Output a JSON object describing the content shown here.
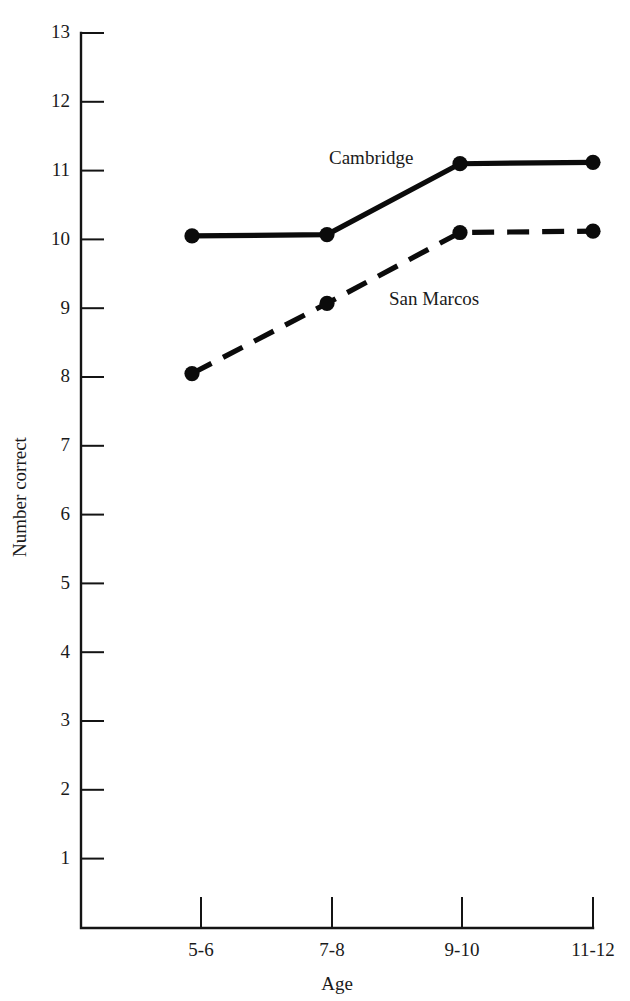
{
  "chart_data": {
    "type": "line",
    "title": "",
    "xlabel": "Age",
    "ylabel": "Number correct",
    "categories": [
      "5-6",
      "7-8",
      "9-10",
      "11-12"
    ],
    "ylim": [
      0,
      13
    ],
    "yticks": [
      1,
      2,
      3,
      4,
      5,
      6,
      7,
      8,
      9,
      10,
      11,
      12,
      13
    ],
    "ytick_labels": [
      "1",
      "2",
      "3",
      "4",
      "5",
      "6",
      "7",
      "8",
      "9",
      "10",
      "11",
      "12",
      "13"
    ],
    "grid": false,
    "legend_position": "inline-annotation",
    "series": [
      {
        "name": "Cambridge",
        "style": "solid",
        "marker": "filled-circle",
        "color": "#0b0b0b",
        "values": [
          10.05,
          10.07,
          11.1,
          11.12
        ],
        "label_text": "Cambridge"
      },
      {
        "name": "San Marcos",
        "style": "dashed",
        "marker": "filled-circle",
        "color": "#0b0b0b",
        "values": [
          8.05,
          9.07,
          10.1,
          10.12
        ],
        "label_text": "San Marcos"
      }
    ],
    "annotations": [
      {
        "text": "Cambridge",
        "series": "Cambridge"
      },
      {
        "text": "San Marcos",
        "series": "San Marcos"
      }
    ]
  }
}
